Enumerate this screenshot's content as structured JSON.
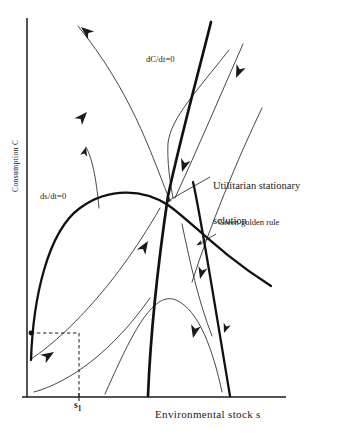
{
  "figure": {
    "type": "phase-diagram",
    "background_color": "#ffffff",
    "ink_color": "#1a1a1a",
    "axes": {
      "y_label": "Consumption C",
      "x_label": "Environmental stock s",
      "origin_px": [
        27,
        397
      ],
      "x_axis_end_px": [
        286,
        397
      ],
      "y_axis_top_px": [
        27,
        18
      ]
    },
    "tick_marks": [
      {
        "name": "s1-tick",
        "label": "s",
        "subscript": "1",
        "x_px": 79
      }
    ],
    "curve_labels": [
      {
        "name": "dC-dt-nullcline-label",
        "text": "dC/dt=0",
        "x_px": 146,
        "y_px": 60
      },
      {
        "name": "ds-dt-nullcline-label",
        "text": "ds/dt=0",
        "x_px": 40,
        "y_px": 197
      }
    ],
    "annotations": [
      {
        "name": "utilitarian-stationary-solution",
        "line1": "Utilitarian stationary",
        "line2": "solution",
        "x_px": 212,
        "y_px": 163,
        "leader_from_px": [
          210,
          176
        ],
        "leader_to_px": [
          163,
          203
        ]
      },
      {
        "name": "green-golden-rule",
        "line1": "Green golden rule",
        "x_px": 215,
        "y_px": 224,
        "leader_from_px": [
          213,
          235
        ],
        "leader_to_px": [
          196,
          246
        ]
      }
    ],
    "nullclines": [
      {
        "name": "dC-dt-nullcline",
        "description": "steep nearly-straight rising thick line",
        "stroke_width": 2.6,
        "path": "M 211 22 C 197 78, 180 140, 168 196 C 160 250, 151 320, 148 396"
      },
      {
        "name": "ds-dt-nullcline",
        "description": "thick inverted-U hump curve from lower-left rising to peak then falling right",
        "stroke_width": 2.3,
        "path": "M 31 360 C 33 300, 47 232, 80 208 C 110 186, 145 190, 168 205 C 192 222, 218 252, 271 286"
      },
      {
        "name": "ds-dt-nullcline-descending-branch",
        "description": "thick steep branch dropping from saddle region to x-axis",
        "stroke_width": 2.3,
        "path": "M 193 182 C 200 210, 209 275, 230 396"
      }
    ],
    "trajectories": [
      {
        "name": "trajectory-upper-left-outgoing",
        "path": "M 168 196 C 150 150, 130 90, 78 26"
      },
      {
        "name": "trajectory-upper-right-incoming",
        "path": "M 243 44 C 220 96, 198 148, 175 198"
      },
      {
        "name": "trajectory-upper-right-far",
        "path": "M 262 108 C 237 160, 210 226, 192 282"
      },
      {
        "name": "trajectory-dCdt-elbow",
        "path": "M 229 50 C 196 92, 171 118, 168 143 C 167 162, 170 182, 173 198"
      },
      {
        "name": "trajectory-left-rising-short",
        "path": "M 99 206 C 96 176, 92 158, 86 147"
      },
      {
        "name": "trajectory-lower-left-into-saddle",
        "path": "M 31 359 C 60 340, 110 290, 160 208"
      },
      {
        "name": "trajectory-lower-left-shallow",
        "path": "M 34 392 C 70 380, 110 350, 148 300"
      },
      {
        "name": "trajectory-lower-middle-hump",
        "path": "M 105 394 C 130 340, 152 292, 176 300 C 198 308, 212 348, 222 392"
      },
      {
        "name": "trajectory-right-descending-outer",
        "path": "M 182 224 C 190 262, 198 300, 212 336"
      }
    ],
    "flow_arrows": [
      {
        "name": "flow-arrow-upper-left",
        "x_px": 81,
        "y_px": 27,
        "angle_deg": -140
      },
      {
        "name": "flow-arrow-mid-left",
        "x_px": 85,
        "y_px": 113,
        "angle_deg": -48
      },
      {
        "name": "flow-arrow-left-short",
        "x_px": 87,
        "y_px": 148,
        "angle_deg": -72
      },
      {
        "name": "flow-arrow-upper-right-down",
        "x_px": 233,
        "y_px": 72,
        "angle_deg": 115
      },
      {
        "name": "flow-arrow-dCdt-down",
        "x_px": 177,
        "y_px": 167,
        "angle_deg": 108
      },
      {
        "name": "flow-arrow-into-saddle",
        "x_px": 146,
        "y_px": 243,
        "angle_deg": -55
      },
      {
        "name": "flow-arrow-right-down",
        "x_px": 199,
        "y_px": 276,
        "angle_deg": 107
      },
      {
        "name": "flow-arrow-right-lower-down",
        "x_px": 210,
        "y_px": 332,
        "angle_deg": 105
      },
      {
        "name": "flow-arrow-far-right-down",
        "x_px": 224,
        "y_px": 330,
        "angle_deg": 112
      },
      {
        "name": "flow-arrow-lower-left-up",
        "x_px": 50,
        "y_px": 355,
        "angle_deg": -35
      }
    ],
    "dashed_guides": [
      {
        "name": "s1-vertical-dashed",
        "path": "M 79 333 L 79 396"
      },
      {
        "name": "s1-horizontal-dashed",
        "path": "M 31 333 L 79 333"
      }
    ],
    "marked_points": [
      {
        "name": "initial-condition-point",
        "x_px": 31,
        "y_px": 333
      }
    ]
  }
}
